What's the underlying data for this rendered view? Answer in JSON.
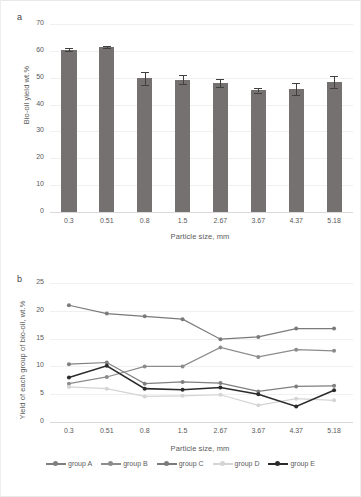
{
  "figure": {
    "panel_a_letter": "a",
    "panel_b_letter": "b"
  },
  "chart_data": [
    {
      "id": "panel-a",
      "type": "bar",
      "title": "",
      "xlabel": "Particle size, mm",
      "ylabel": "Bio-oil yield wt.%",
      "categories": [
        "0.3",
        "0.51",
        "0.8",
        "1.5",
        "2.67",
        "3.67",
        "4.37",
        "5.18"
      ],
      "values": [
        60.5,
        61.5,
        49.8,
        49.3,
        48.2,
        45.3,
        45.8,
        48.5
      ],
      "errors": [
        0.6,
        0.5,
        2.4,
        1.7,
        1.5,
        0.8,
        2.4,
        2.3
      ],
      "ylim": [
        0,
        70
      ],
      "yticks": [
        0,
        10,
        20,
        30,
        40,
        50,
        60,
        70
      ],
      "grid": true,
      "bar_color": "#767171",
      "error_color": "#404040"
    },
    {
      "id": "panel-b",
      "type": "line",
      "title": "",
      "xlabel": "Particle size, mm",
      "ylabel": "Yield of each group of bio-oil, wt.%",
      "categories": [
        "0.3",
        "0.51",
        "0.8",
        "1.5",
        "2.67",
        "3.67",
        "4.37",
        "5.18"
      ],
      "ylim": [
        0,
        25
      ],
      "yticks": [
        0,
        5,
        10,
        15,
        20,
        25
      ],
      "grid": true,
      "legend_position": "bottom",
      "series": [
        {
          "name": "group A",
          "color": "#7f7f7f",
          "values": [
            10.4,
            10.7,
            6.9,
            7.2,
            7.0,
            5.5,
            6.4,
            6.5
          ]
        },
        {
          "name": "group B",
          "color": "#8c8c8c",
          "values": [
            6.9,
            8.1,
            10.0,
            10.0,
            13.4,
            11.7,
            13.0,
            12.8
          ]
        },
        {
          "name": "group C",
          "color": "#7a7a7a",
          "values": [
            21.0,
            19.5,
            19.0,
            18.5,
            14.9,
            15.3,
            16.8,
            16.8
          ]
        },
        {
          "name": "group D",
          "color": "#d4d4d4",
          "values": [
            6.3,
            6.0,
            4.6,
            4.7,
            4.9,
            3.0,
            4.2,
            3.9
          ]
        },
        {
          "name": "group E",
          "color": "#2b2b2b",
          "values": [
            8.0,
            10.1,
            6.0,
            5.8,
            6.2,
            5.0,
            2.8,
            5.7
          ]
        }
      ]
    }
  ]
}
